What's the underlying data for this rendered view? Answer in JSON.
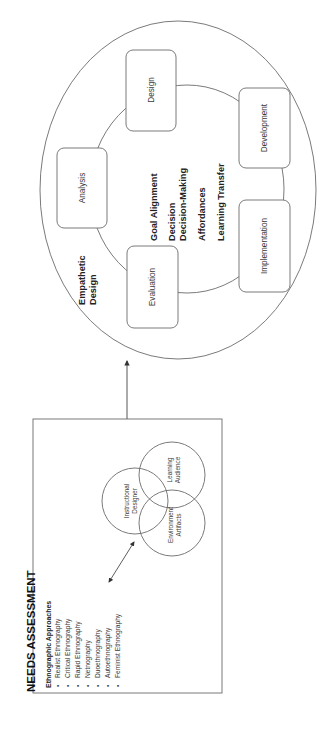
{
  "orientation": "rotated 90deg counter-clockwise",
  "needs_assessment": {
    "title": "NEEDS ASSESSMENT",
    "list_heading": "Ethnographic Approaches",
    "bullet": "•",
    "items": [
      "Realist Ethnography",
      "Critical Ethnography",
      "Rapid Ethnography",
      "Netnography",
      "Duoethnography",
      "Autoethnography",
      "Feminist Ethnography"
    ],
    "venn": {
      "instructional_designer": [
        "Instructional",
        "Designer"
      ],
      "learning_audience": [
        "Learning",
        "Audience"
      ],
      "environment_artifacts": [
        "Environment",
        "Artifacts"
      ]
    }
  },
  "empathetic_design": {
    "label": [
      "Empathetic",
      "Design"
    ],
    "phases": {
      "analysis": "Analysis",
      "design": "Design",
      "development": "Development",
      "implementation": "Implementation",
      "evaluation": "Evaluation"
    },
    "center_terms": [
      "Goal Alignment",
      "Decision",
      "Decision-Making",
      "Affordances",
      "Learning Transfer"
    ]
  },
  "colors": {
    "stroke": "#6b6b6b",
    "text": "#2a2a2a",
    "background": "#ffffff"
  }
}
